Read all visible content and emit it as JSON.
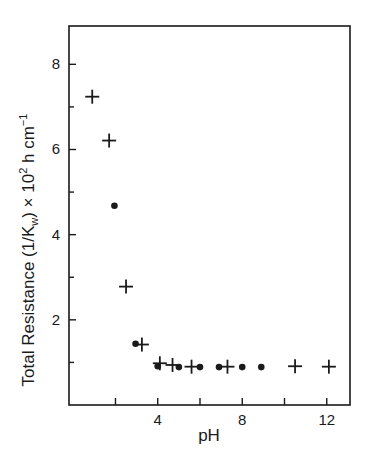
{
  "chart_data": {
    "type": "scatter",
    "title": "",
    "xlabel": "pH",
    "ylabel": {
      "prefix": "Total  Resistance  (1/K",
      "sub": "w",
      "mid": ")  × 10",
      "sup": "2",
      "suffix": " h cm",
      "sup2": "−1"
    },
    "ylabel_plain": "Total Resistance (1/Kw) × 10^2 h cm^-1",
    "xlim": [
      -0.2,
      13.1
    ],
    "ylim": [
      0,
      8.9
    ],
    "x_ticks_major": [
      4,
      8,
      12
    ],
    "x_ticks_minor": [
      2,
      6,
      10
    ],
    "y_ticks_major": [
      2,
      4,
      6,
      8
    ],
    "y_ticks_minor": [
      1,
      3,
      5,
      7
    ],
    "grid": false,
    "legend": null,
    "series": [
      {
        "name": "plus-markers",
        "marker": "plus",
        "points": [
          {
            "x": 0.9,
            "y": 7.24
          },
          {
            "x": 1.7,
            "y": 6.21
          },
          {
            "x": 2.5,
            "y": 2.78
          },
          {
            "x": 3.25,
            "y": 1.42
          },
          {
            "x": 4.1,
            "y": 0.98
          },
          {
            "x": 4.7,
            "y": 0.94
          },
          {
            "x": 5.6,
            "y": 0.9
          },
          {
            "x": 7.3,
            "y": 0.9
          },
          {
            "x": 10.5,
            "y": 0.91
          },
          {
            "x": 12.1,
            "y": 0.9
          }
        ]
      },
      {
        "name": "dot-markers",
        "marker": "dot",
        "points": [
          {
            "x": 1.95,
            "y": 4.68
          },
          {
            "x": 2.95,
            "y": 1.44
          },
          {
            "x": 4.0,
            "y": 0.91
          },
          {
            "x": 5.0,
            "y": 0.89
          },
          {
            "x": 6.0,
            "y": 0.89
          },
          {
            "x": 6.9,
            "y": 0.89
          },
          {
            "x": 8.0,
            "y": 0.89
          },
          {
            "x": 8.9,
            "y": 0.89
          }
        ]
      }
    ]
  },
  "colors": {
    "ink": "#1a1a1a",
    "background": "#ffffff"
  }
}
